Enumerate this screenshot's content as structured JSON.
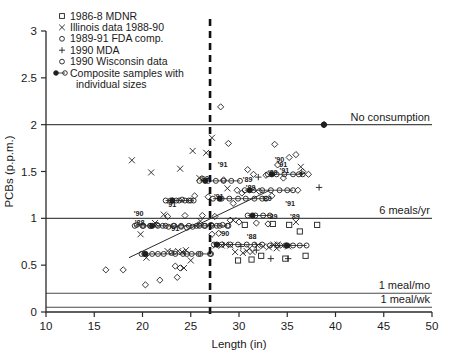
{
  "chart_data": {
    "type": "scatter",
    "title": "",
    "xlabel": "Length (in)",
    "ylabel": "PCBs (p.p.m.)",
    "xlim": [
      10,
      50
    ],
    "ylim": [
      0,
      3
    ],
    "xticks": [
      10,
      15,
      20,
      25,
      30,
      35,
      40,
      45,
      50
    ],
    "yticks": [
      0,
      0.5,
      1,
      1.5,
      2,
      2.5,
      3
    ],
    "grid": false,
    "legend_position": "top-left",
    "legend": [
      {
        "label": "1986-8 MDNR",
        "marker": "square"
      },
      {
        "label": "Illinois data 1988-90",
        "marker": "cross"
      },
      {
        "label": "1989-91 FDA comp.",
        "marker": "diamond"
      },
      {
        "label": "1990 MDA",
        "marker": "plus"
      },
      {
        "label": "1990 Wisconsin data",
        "marker": "circle"
      },
      {
        "label": "Composite samples with individual sizes",
        "marker": "composite"
      }
    ],
    "guidelines": [
      {
        "label": "No consumption",
        "y": 2.0
      },
      {
        "label": "6 meals/yr",
        "y": 1.0
      },
      {
        "label": "1 meal/mo",
        "y": 0.2
      },
      {
        "label": "1 meal/wk",
        "y": 0.05
      }
    ],
    "vertical_marker": {
      "x": 27,
      "style": "dashed"
    },
    "trendline": {
      "x0": 18.6,
      "y0": 0.58,
      "x1": 33.2,
      "y1": 1.3
    },
    "year_annotations": [
      {
        "text": "'90",
        "x": 19.6,
        "y": 1.02
      },
      {
        "text": "'88",
        "x": 19.7,
        "y": 0.93
      },
      {
        "text": "'91",
        "x": 23.0,
        "y": 1.12
      },
      {
        "text": "'91",
        "x": 23.3,
        "y": 0.86
      },
      {
        "text": "'89",
        "x": 26.4,
        "y": 1.4
      },
      {
        "text": "'91",
        "x": 27.9,
        "y": 1.21
      },
      {
        "text": "'90",
        "x": 28.5,
        "y": 0.81
      },
      {
        "text": "'89",
        "x": 30.9,
        "y": 1.39
      },
      {
        "text": "'89",
        "x": 31.2,
        "y": 1.3
      },
      {
        "text": "'89",
        "x": 32.9,
        "y": 1.18
      },
      {
        "text": "'89",
        "x": 33.5,
        "y": 1.46
      },
      {
        "text": "'90",
        "x": 34.2,
        "y": 1.6
      },
      {
        "text": "'91",
        "x": 34.7,
        "y": 1.48
      },
      {
        "text": "'91",
        "x": 35.3,
        "y": 1.13
      },
      {
        "text": "'89",
        "x": 35.8,
        "y": 0.99
      },
      {
        "text": "'88",
        "x": 31.3,
        "y": 0.78
      },
      {
        "text": "'89",
        "x": 33.5,
        "y": 0.99
      },
      {
        "text": "'91",
        "x": 34.5,
        "y": 1.55
      },
      {
        "text": "'91",
        "x": 28.3,
        "y": 1.55
      }
    ],
    "series": [
      {
        "name": "1986-8 MDNR",
        "marker": "square",
        "points": [
          [
            30.6,
            0.93
          ],
          [
            31.3,
            0.56
          ],
          [
            33.5,
            0.94
          ],
          [
            34.8,
            0.57
          ],
          [
            35.2,
            0.93
          ],
          [
            36.3,
            0.86
          ],
          [
            36.9,
            0.6
          ],
          [
            38.1,
            0.93
          ],
          [
            29.9,
            0.55
          ],
          [
            32.3,
            0.6
          ]
        ]
      },
      {
        "name": "Illinois data 1988-90",
        "marker": "cross",
        "points": [
          [
            18.9,
            1.62
          ],
          [
            20.4,
            0.58
          ],
          [
            21.3,
            0.95
          ],
          [
            22.2,
            1.04
          ],
          [
            22.6,
            0.65
          ],
          [
            23.1,
            0.64
          ],
          [
            23.7,
            0.65
          ],
          [
            24.1,
            0.64
          ],
          [
            24.5,
            0.66
          ],
          [
            25.0,
            0.55
          ],
          [
            25.2,
            1.72
          ],
          [
            25.9,
            1.43
          ],
          [
            26.6,
            1.7
          ],
          [
            27.2,
            1.86
          ],
          [
            27.6,
            0.71
          ],
          [
            28.2,
            0.71
          ],
          [
            28.6,
            0.72
          ],
          [
            29.1,
            0.71
          ],
          [
            29.6,
            0.64
          ],
          [
            30.4,
            0.63
          ],
          [
            30.8,
            0.65
          ],
          [
            31.4,
            0.64
          ],
          [
            31.9,
            0.71
          ],
          [
            32.5,
            0.7
          ],
          [
            33.1,
            0.69
          ],
          [
            33.6,
            0.72
          ],
          [
            34.0,
            0.72
          ],
          [
            34.6,
            0.71
          ],
          [
            35.1,
            0.7
          ],
          [
            35.9,
            0.96
          ],
          [
            36.4,
            1.55
          ],
          [
            28.8,
            1.32
          ],
          [
            26.0,
            0.97
          ],
          [
            24.3,
            0.47
          ],
          [
            19.8,
            0.83
          ],
          [
            20.9,
            1.49
          ],
          [
            23.9,
            1.53
          ],
          [
            29.4,
            0.98
          ],
          [
            31.1,
            0.68
          ],
          [
            33.9,
            0.68
          ]
        ]
      },
      {
        "name": "1989-91 FDA comp.",
        "marker": "diamond",
        "points": [
          [
            16.2,
            0.45
          ],
          [
            18.0,
            0.45
          ],
          [
            20.3,
            0.29
          ],
          [
            21.8,
            0.34
          ],
          [
            23.4,
            0.49
          ],
          [
            23.9,
            0.47
          ],
          [
            23.6,
            0.37
          ],
          [
            26.2,
            1.03
          ],
          [
            27.5,
            1.02
          ],
          [
            28.1,
            2.19
          ],
          [
            28.4,
            1.41
          ],
          [
            29.4,
            1.16
          ],
          [
            29.8,
            1.3
          ],
          [
            30.3,
            1.27
          ],
          [
            30.9,
            1.52
          ],
          [
            31.5,
            1.47
          ],
          [
            32.1,
            1.29
          ],
          [
            32.8,
            1.46
          ],
          [
            33.4,
            1.24
          ],
          [
            34.0,
            1.57
          ],
          [
            34.6,
            1.43
          ],
          [
            35.2,
            1.65
          ],
          [
            35.9,
            1.68
          ],
          [
            36.6,
            1.5
          ],
          [
            29.1,
            0.98
          ],
          [
            30.0,
            0.96
          ],
          [
            31.8,
            0.95
          ],
          [
            33.0,
            0.94
          ],
          [
            27.2,
            0.83
          ],
          [
            27.9,
            0.84
          ],
          [
            25.4,
            1.24
          ],
          [
            26.8,
            1.23
          ],
          [
            22.6,
            1.02
          ],
          [
            24.4,
            1.03
          ],
          [
            25.8,
            0.93
          ],
          [
            28.9,
            1.8
          ],
          [
            33.7,
            1.79
          ],
          [
            36.1,
            1.3
          ],
          [
            37.2,
            1.47
          ],
          [
            38.8,
            2.0
          ]
        ]
      },
      {
        "name": "1990 MDA",
        "marker": "plus",
        "points": [
          [
            32.0,
            1.44
          ],
          [
            36.5,
            1.48
          ],
          [
            33.3,
            0.57
          ],
          [
            31.8,
            0.66
          ],
          [
            38.3,
            1.33
          ],
          [
            30.2,
            0.7
          ],
          [
            35.1,
            0.57
          ]
        ]
      },
      {
        "name": "1990 Wisconsin data",
        "marker": "circle",
        "points": [
          [
            19.4,
            0.93
          ],
          [
            20.1,
            0.92
          ],
          [
            20.8,
            0.92
          ],
          [
            21.5,
            0.93
          ],
          [
            22.1,
            0.92
          ],
          [
            22.7,
            0.91
          ],
          [
            23.3,
            0.92
          ],
          [
            24.0,
            0.91
          ],
          [
            24.6,
            0.9
          ],
          [
            25.2,
            0.91
          ],
          [
            25.9,
            0.92
          ],
          [
            26.5,
            0.92
          ],
          [
            27.1,
            0.93
          ],
          [
            27.7,
            0.92
          ],
          [
            28.3,
            0.93
          ],
          [
            28.9,
            0.92
          ],
          [
            22.9,
            1.19
          ],
          [
            23.5,
            1.19
          ],
          [
            24.1,
            1.2
          ],
          [
            24.8,
            1.19
          ],
          [
            20.2,
            0.62
          ],
          [
            21.6,
            0.62
          ],
          [
            23.0,
            0.63
          ],
          [
            24.2,
            0.62
          ],
          [
            25.1,
            0.62
          ],
          [
            26.0,
            0.62
          ],
          [
            27.0,
            0.62
          ]
        ]
      }
    ],
    "composites": [
      {
        "y": 1.19,
        "x_start": 22.4,
        "x_end": 25.3,
        "center": 23.1,
        "sizes": [
          22.4,
          23.1,
          23.8,
          24.4,
          25.0,
          25.3
        ]
      },
      {
        "y": 0.92,
        "x_start": 19.2,
        "x_end": 28.8,
        "center": 21.0,
        "sizes": [
          19.2,
          20.0,
          20.8,
          21.6,
          22.4,
          23.2,
          24.0,
          24.8,
          25.6,
          26.4,
          27.2,
          28.0,
          28.8
        ]
      },
      {
        "y": 1.4,
        "x_start": 25.9,
        "x_end": 30.1,
        "center": 26.5,
        "sizes": [
          25.9,
          26.8,
          27.6,
          28.4,
          29.2,
          30.1
        ]
      },
      {
        "y": 1.21,
        "x_start": 27.3,
        "x_end": 32.8,
        "center": 28.0,
        "sizes": [
          27.3,
          28.2,
          29.0,
          29.9,
          30.7,
          31.6,
          32.4,
          32.8
        ]
      },
      {
        "y": 0.62,
        "x_start": 19.9,
        "x_end": 27.1,
        "center": 20.3,
        "sizes": [
          19.9,
          21.0,
          22.2,
          23.4,
          24.6,
          25.8,
          27.1
        ]
      },
      {
        "y": 0.72,
        "x_start": 27.4,
        "x_end": 32.4,
        "center": 27.7,
        "sizes": [
          27.4,
          28.2,
          29.1,
          29.9,
          30.8,
          31.6,
          32.4
        ]
      },
      {
        "y": 1.3,
        "x_start": 30.6,
        "x_end": 35.6,
        "center": 31.1,
        "sizes": [
          30.6,
          31.5,
          32.4,
          33.3,
          34.2,
          35.0,
          35.6
        ]
      },
      {
        "y": 1.47,
        "x_start": 33.0,
        "x_end": 36.6,
        "center": 33.4,
        "sizes": [
          33.0,
          33.9,
          34.7,
          35.6,
          36.2,
          36.6
        ]
      },
      {
        "y": 0.71,
        "x_start": 33.2,
        "x_end": 37.0,
        "center": 35.0,
        "sizes": [
          33.2,
          34.0,
          34.8,
          35.6,
          36.3,
          37.0
        ]
      },
      {
        "y": 2.0,
        "x_start": 38.8,
        "x_end": 38.8,
        "center": 38.8,
        "sizes": [
          38.8
        ]
      },
      {
        "y": 1.03,
        "x_start": 30.9,
        "x_end": 33.2,
        "center": 31.4,
        "sizes": [
          30.9,
          31.7,
          32.5,
          33.2
        ]
      }
    ]
  }
}
